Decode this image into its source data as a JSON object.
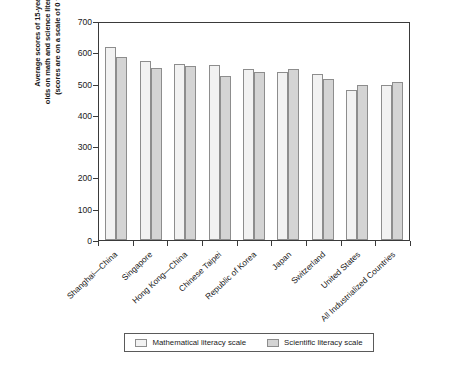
{
  "chart_data": {
    "type": "bar",
    "title": "",
    "xlabel": "",
    "ylabel": "Average scores of 15-year > 11 olds on math and science literacy scales (scores are on a scale of 0 to 1,000)",
    "ylim": [
      0,
      700
    ],
    "yticks": [
      0,
      100,
      200,
      300,
      400,
      500,
      600,
      700
    ],
    "grid": false,
    "legend_position": "bottom",
    "categories": [
      "Shanghai—China",
      "Singapore",
      "Hong Kong—China",
      "Chinese Taipei",
      "Republic of Korea",
      "Japan",
      "Switzerland",
      "United States",
      "All Industrialized Countries"
    ],
    "series": [
      {
        "name": "Mathematical  literacy scale",
        "color": "#f2f2f2",
        "values": [
          617,
          573,
          562,
          560,
          546,
          536,
          531,
          481,
          494
        ]
      },
      {
        "name": "Scientific literacy scale",
        "color": "#d4d4d4",
        "values": [
          585,
          551,
          555,
          523,
          538,
          547,
          515,
          497,
          506
        ]
      }
    ]
  },
  "axis": {
    "ytitle_lines": [
      "Average scores of 15-year > 11",
      "olds on math and science literacy scales",
      "(scores are on a scale of 0 to 1,000)"
    ]
  },
  "legend": {
    "items": [
      {
        "label": "Mathematical  literacy scale"
      },
      {
        "label": "Scientific literacy scale"
      }
    ]
  },
  "footer": {
    "note": ""
  }
}
